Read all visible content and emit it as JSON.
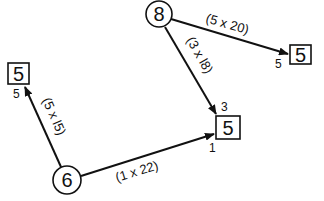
{
  "diagram": {
    "nodes": [
      {
        "id": "n8",
        "shape": "circle",
        "label": "8"
      },
      {
        "id": "n6",
        "shape": "circle",
        "label": "6"
      },
      {
        "id": "b_left",
        "shape": "box",
        "label": "5"
      },
      {
        "id": "b_center",
        "shape": "box",
        "label": "5"
      },
      {
        "id": "b_right",
        "shape": "box",
        "label": "5"
      }
    ],
    "edges": [
      {
        "from": "n8",
        "to": "b_right",
        "label": "(5 x 20)",
        "port": "5"
      },
      {
        "from": "n8",
        "to": "b_center",
        "label": "(3 x l8)",
        "port": "3"
      },
      {
        "from": "n6",
        "to": "b_left",
        "label": "(5 x l5)",
        "port": "5"
      },
      {
        "from": "n6",
        "to": "b_center",
        "label": "(1 x 22)",
        "port": "1"
      }
    ]
  }
}
